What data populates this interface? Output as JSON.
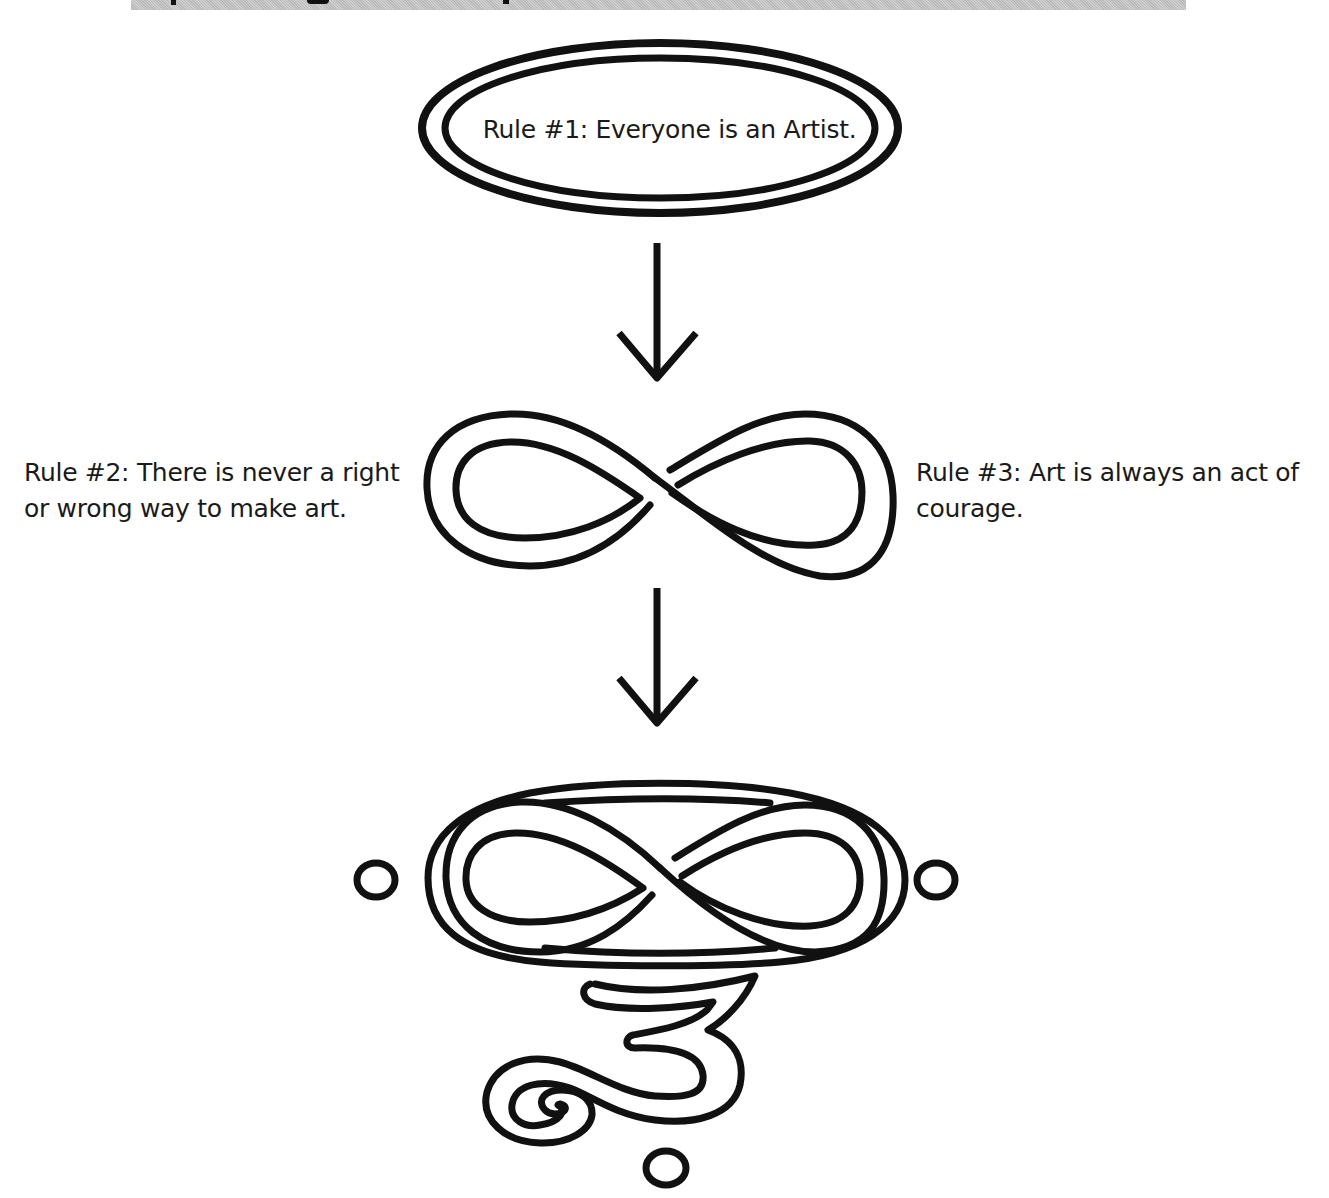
{
  "header": {
    "banner_color": "#c4c4c4",
    "note": ""
  },
  "rules": [
    {
      "id": "rule-1",
      "text": "Rule #1: Everyone is an Artist."
    },
    {
      "id": "rule-2",
      "line1": "Rule #2: There is never a right",
      "line2": "or wrong way to make art."
    },
    {
      "id": "rule-3",
      "line1": "Rule #3: Art is always an act of",
      "line2": "courage."
    }
  ],
  "symbols": {
    "top": "double-oval",
    "middle": "infinity",
    "bottom": "infinity-in-oval-with-3-and-dots"
  },
  "colors": {
    "stroke": "#111111",
    "background": "#ffffff",
    "text": "#1a1a1a"
  }
}
